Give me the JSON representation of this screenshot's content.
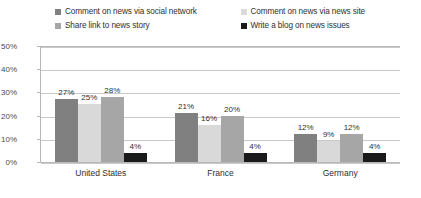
{
  "chart_data": {
    "type": "bar",
    "title": "",
    "xlabel": "",
    "ylabel": "",
    "ylim": [
      0,
      50
    ],
    "yticks": [
      "0%",
      "10%",
      "20%",
      "30%",
      "40%",
      "50%"
    ],
    "ytick_values": [
      0,
      10,
      20,
      30,
      40,
      50
    ],
    "grid": true,
    "legend_position": "top",
    "categories": [
      "United States",
      "France",
      "Germany"
    ],
    "series": [
      {
        "name": "Comment on news via social network",
        "color": "#808080",
        "values": [
          27,
          21,
          12
        ],
        "labels": [
          "27%",
          "21%",
          "12%"
        ]
      },
      {
        "name": "Comment on news via news site",
        "color": "#d9d9d9",
        "values": [
          25,
          16,
          9
        ],
        "labels": [
          "25%",
          "16%",
          "9%"
        ]
      },
      {
        "name": "Share link to news story",
        "color": "#a6a6a6",
        "values": [
          28,
          20,
          12
        ],
        "labels": [
          "28%",
          "20%",
          "12%"
        ]
      },
      {
        "name": "Write a blog on news issues",
        "color": "#1a1a1a",
        "values": [
          4,
          4,
          4
        ],
        "labels": [
          "4%",
          "4%",
          "4%"
        ]
      }
    ]
  }
}
